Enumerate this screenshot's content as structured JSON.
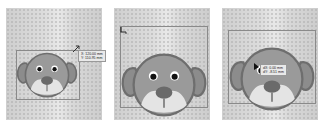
{
  "panels": [
    {
      "id": "panel-1",
      "step": "scale",
      "tooltip": {
        "line1": "X: 120.00 mm",
        "line2": "Y: 110.95 mm"
      }
    },
    {
      "id": "panel-2",
      "step": "scaled-result"
    },
    {
      "id": "panel-3",
      "step": "move",
      "tooltip": {
        "line1": "dX: 0.00 mm",
        "line2": "dY: -8.51 mm"
      }
    }
  ],
  "colors": {
    "face": "#9a9a9a",
    "ear": "#8c8c8c",
    "outline": "#6e6e6e",
    "muzzle": "#e4e4e4",
    "nose": "#6a6a6a",
    "canvas": "#d4d4d4"
  }
}
